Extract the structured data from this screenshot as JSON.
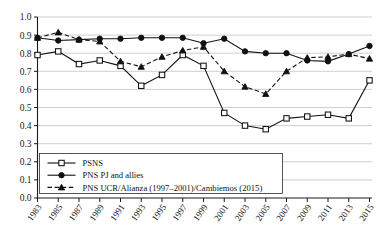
{
  "chart_data": {
    "type": "line",
    "title": "",
    "xlabel": "",
    "ylabel": "",
    "ylim": [
      0.0,
      1.0
    ],
    "ytick_step": 0.1,
    "grid": true,
    "legend_position": "bottom-left",
    "x": [
      1983,
      1985,
      1987,
      1989,
      1991,
      1993,
      1995,
      1997,
      1999,
      2001,
      2003,
      2005,
      2007,
      2009,
      2011,
      2013,
      2015
    ],
    "xtick_labels": [
      "1983",
      "1985",
      "1987",
      "1989",
      "1991",
      "1993",
      "1995",
      "1997",
      "1999",
      "2001",
      "2003",
      "2005",
      "2007",
      "2009",
      "2011",
      "2013",
      "2015"
    ],
    "ytick_labels": [
      "0.0",
      "0.1",
      "0.2",
      "0.3",
      "0.4",
      "0.5",
      "0.6",
      "0.7",
      "0.8",
      "0.9",
      "1.0"
    ],
    "ytick_values": [
      0.0,
      0.1,
      0.2,
      0.3,
      0.4,
      0.5,
      0.6,
      0.7,
      0.8,
      0.9,
      1.0
    ],
    "series": [
      {
        "name": "PSNS",
        "marker": "open-square",
        "line": "solid",
        "values": [
          0.79,
          0.81,
          0.74,
          0.76,
          0.73,
          0.62,
          0.68,
          0.79,
          0.73,
          0.47,
          0.4,
          0.38,
          0.44,
          0.45,
          0.46,
          0.44,
          0.65
        ]
      },
      {
        "name": "PNS PJ and allies",
        "marker": "filled-circle",
        "line": "solid",
        "values": [
          0.885,
          0.87,
          0.875,
          0.88,
          0.88,
          0.885,
          0.885,
          0.885,
          0.855,
          0.88,
          0.81,
          0.8,
          0.8,
          0.76,
          0.755,
          0.795,
          0.84
        ]
      },
      {
        "name": "PNS UCR/Alianza (1997–2001)/Cambiemos (2015)",
        "marker": "filled-triangle",
        "line": "dashed",
        "values": [
          0.885,
          0.915,
          0.875,
          0.865,
          0.755,
          0.725,
          0.78,
          0.815,
          0.835,
          0.7,
          0.615,
          0.575,
          0.7,
          0.775,
          0.78,
          0.795,
          0.77
        ]
      }
    ]
  },
  "legend": {
    "entries": [
      {
        "label": "PSNS"
      },
      {
        "label": "PNS PJ and allies"
      },
      {
        "label": "PNS UCR/Alianza (1997–2001)/Cambiemos (2015)"
      }
    ]
  }
}
